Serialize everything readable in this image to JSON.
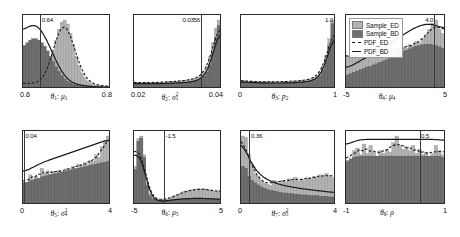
{
  "figure": {
    "type": "histogram-grid",
    "rows": 2,
    "cols": 4,
    "background": "#ffffff",
    "colors": {
      "sample_ed": "#b3b3b3",
      "sample_bd": "#6e6e6e",
      "pdf_ed": "#1a1a1a",
      "pdf_bd": "#1a1a1a",
      "axis": "#2b2b2b",
      "vline": "#3a3a3a"
    }
  },
  "legend": {
    "position": "top-right-panel",
    "items": [
      {
        "label": "Sample_ED",
        "marker": "swatch",
        "color": "#b3b3b3"
      },
      {
        "label": "Sample_BD",
        "marker": "swatch",
        "color": "#6e6e6e"
      },
      {
        "label": "PDF_ED",
        "marker": "dashed-line",
        "color": "#1a1a1a"
      },
      {
        "label": "PDF_BD",
        "marker": "solid-line",
        "color": "#1a1a1a"
      }
    ]
  },
  "chart_data": {
    "type": "bar",
    "title": "",
    "xlabel": "",
    "ylabel": "",
    "grid": false,
    "legend": [
      "Sample_ED",
      "Sample_BD",
      "PDF_ED",
      "PDF_BD"
    ],
    "panels": [
      {
        "index": 1,
        "xlabel_theta": "θ",
        "xlabel_theta_sub": "1",
        "xlabel_param": "μ",
        "xlabel_param_sub": "1",
        "xlabel_param_sup": "",
        "xlabel_text": "θ₁: μ₁",
        "xmin": 0.6,
        "xmax": 0.8,
        "xticks": [
          "0.6",
          "0.8"
        ],
        "vline_value": 0.64,
        "vline_label": "0.64",
        "vline_label_side": "right",
        "ed_values": [
          0.06,
          0.05,
          0.05,
          0.05,
          0.06,
          0.07,
          0.09,
          0.12,
          0.2,
          0.34,
          0.52,
          0.7,
          0.86,
          0.97,
          1.0,
          0.94,
          0.8,
          0.63,
          0.46,
          0.32,
          0.21,
          0.14,
          0.09,
          0.06,
          0.04,
          0.03,
          0.02,
          0.02,
          0.01,
          0.01
        ],
        "bd_values": [
          0.62,
          0.66,
          0.7,
          0.72,
          0.72,
          0.7,
          0.66,
          0.61,
          0.54,
          0.46,
          0.38,
          0.3,
          0.23,
          0.17,
          0.12,
          0.08,
          0.06,
          0.04,
          0.03,
          0.02,
          0.02,
          0.01,
          0.01,
          0.01,
          0.0,
          0.0,
          0.0,
          0.0,
          0.0,
          0.0
        ]
      },
      {
        "index": 2,
        "xlabel_theta": "θ",
        "xlabel_theta_sub": "2",
        "xlabel_param": "σ",
        "xlabel_param_sub": "1",
        "xlabel_param_sup": "2",
        "xlabel_text": "θ₂: σ₁²",
        "xmin": 0.02,
        "xmax": 0.04,
        "xticks": [
          "0.02",
          "0.04"
        ],
        "vline_value": 0.0356,
        "vline_label": "0.0356",
        "vline_label_side": "left",
        "ed_values": [
          0.07,
          0.07,
          0.06,
          0.07,
          0.07,
          0.06,
          0.07,
          0.07,
          0.07,
          0.07,
          0.07,
          0.08,
          0.08,
          0.08,
          0.08,
          0.09,
          0.09,
          0.1,
          0.1,
          0.11,
          0.12,
          0.13,
          0.15,
          0.18,
          0.23,
          0.31,
          0.45,
          0.66,
          0.88,
          1.0
        ],
        "bd_values": [
          0.05,
          0.05,
          0.05,
          0.05,
          0.05,
          0.05,
          0.05,
          0.05,
          0.05,
          0.05,
          0.05,
          0.05,
          0.05,
          0.06,
          0.06,
          0.06,
          0.06,
          0.06,
          0.07,
          0.07,
          0.08,
          0.09,
          0.1,
          0.12,
          0.16,
          0.22,
          0.33,
          0.52,
          0.74,
          0.92
        ]
      },
      {
        "index": 3,
        "xlabel_theta": "θ",
        "xlabel_theta_sub": "3",
        "xlabel_param": "p",
        "xlabel_param_sub": "2",
        "xlabel_param_sup": "",
        "xlabel_text": "θ₃: p₂",
        "xmin": 0,
        "xmax": 1,
        "xticks": [
          "0",
          "1"
        ],
        "vline_value": 1.0,
        "vline_label": "1.0",
        "vline_label_side": "left",
        "ed_values": [
          0.1,
          0.09,
          0.08,
          0.09,
          0.08,
          0.08,
          0.08,
          0.07,
          0.08,
          0.08,
          0.08,
          0.07,
          0.08,
          0.08,
          0.08,
          0.08,
          0.09,
          0.09,
          0.09,
          0.1,
          0.1,
          0.11,
          0.12,
          0.14,
          0.17,
          0.22,
          0.31,
          0.47,
          0.72,
          1.0
        ],
        "bd_values": [
          0.08,
          0.07,
          0.07,
          0.07,
          0.07,
          0.06,
          0.06,
          0.06,
          0.06,
          0.06,
          0.06,
          0.06,
          0.06,
          0.06,
          0.06,
          0.06,
          0.06,
          0.07,
          0.07,
          0.07,
          0.08,
          0.08,
          0.09,
          0.1,
          0.13,
          0.17,
          0.25,
          0.39,
          0.62,
          0.95
        ]
      },
      {
        "index": 4,
        "xlabel_theta": "θ",
        "xlabel_theta_sub": "4",
        "xlabel_param": "μ",
        "xlabel_param_sub": "4",
        "xlabel_param_sup": "",
        "xlabel_text": "θ₄: μ₄",
        "xmin": -5,
        "xmax": 5,
        "xticks": [
          "-5",
          "5"
        ],
        "vline_value": 4.0,
        "vline_label": "4.0",
        "vline_label_side": "left",
        "ed_values": [
          0.46,
          0.47,
          0.45,
          0.5,
          0.46,
          0.52,
          0.47,
          0.51,
          0.46,
          0.52,
          0.48,
          0.53,
          0.5,
          0.55,
          0.52,
          0.58,
          0.55,
          0.6,
          0.58,
          0.63,
          0.62,
          0.68,
          0.66,
          0.72,
          0.78,
          0.86,
          0.95,
          1.0,
          0.86,
          0.8
        ],
        "bd_values": [
          0.18,
          0.2,
          0.22,
          0.24,
          0.26,
          0.28,
          0.3,
          0.31,
          0.33,
          0.35,
          0.37,
          0.39,
          0.41,
          0.44,
          0.46,
          0.48,
          0.5,
          0.53,
          0.55,
          0.57,
          0.59,
          0.61,
          0.62,
          0.63,
          0.64,
          0.64,
          0.63,
          0.62,
          0.6,
          0.58
        ]
      },
      {
        "index": 5,
        "xlabel_theta": "θ",
        "xlabel_theta_sub": "5",
        "xlabel_param": "σ",
        "xlabel_param_sub": "4",
        "xlabel_param_sup": "2",
        "xlabel_text": "θ₅: σ₄²",
        "xmin": 0,
        "xmax": 4,
        "xticks": [
          "0",
          "4"
        ],
        "vline_value": 0.04,
        "vline_label": "0.04",
        "vline_label_side": "right",
        "ed_values": [
          0.31,
          0.3,
          0.42,
          0.36,
          0.4,
          0.36,
          0.52,
          0.44,
          0.48,
          0.43,
          0.47,
          0.45,
          0.49,
          0.47,
          0.48,
          0.52,
          0.5,
          0.55,
          0.52,
          0.58,
          0.56,
          0.6,
          0.58,
          0.64,
          0.62,
          0.72,
          0.68,
          0.84,
          0.94,
          1.0
        ],
        "bd_values": [
          0.3,
          0.31,
          0.33,
          0.34,
          0.36,
          0.37,
          0.39,
          0.4,
          0.41,
          0.42,
          0.43,
          0.44,
          0.45,
          0.46,
          0.47,
          0.48,
          0.49,
          0.5,
          0.51,
          0.52,
          0.53,
          0.54,
          0.55,
          0.56,
          0.57,
          0.58,
          0.59,
          0.6,
          0.61,
          0.62
        ]
      },
      {
        "index": 6,
        "xlabel_theta": "θ",
        "xlabel_theta_sub": "6",
        "xlabel_param": "μ",
        "xlabel_param_sub": "5",
        "xlabel_param_sup": "",
        "xlabel_text": "θ₆: μ₅",
        "xmin": -5,
        "xmax": 5,
        "xticks": [
          "-5",
          "5"
        ],
        "vline_value": -1.5,
        "vline_label": "-1.5",
        "vline_label_side": "right",
        "ed_values": [
          0.55,
          0.96,
          1.0,
          0.72,
          0.3,
          0.14,
          0.08,
          0.06,
          0.05,
          0.05,
          0.05,
          0.06,
          0.07,
          0.09,
          0.11,
          0.13,
          0.15,
          0.17,
          0.18,
          0.19,
          0.2,
          0.2,
          0.21,
          0.21,
          0.21,
          0.2,
          0.19,
          0.18,
          0.17,
          0.18
        ],
        "bd_values": [
          0.5,
          0.92,
          0.97,
          0.68,
          0.26,
          0.11,
          0.06,
          0.04,
          0.03,
          0.03,
          0.03,
          0.03,
          0.04,
          0.05,
          0.05,
          0.06,
          0.06,
          0.06,
          0.07,
          0.07,
          0.07,
          0.07,
          0.07,
          0.07,
          0.07,
          0.07,
          0.06,
          0.06,
          0.06,
          0.06
        ]
      },
      {
        "index": 7,
        "xlabel_theta": "θ",
        "xlabel_theta_sub": "7",
        "xlabel_param": "σ",
        "xlabel_param_sub": "5",
        "xlabel_param_sup": "2",
        "xlabel_text": "θ₇: σ₅²",
        "xmin": 0,
        "xmax": 4,
        "xticks": [
          "0",
          "4"
        ],
        "vline_value": 0.36,
        "vline_label": "0.36",
        "vline_label_side": "right",
        "ed_values": [
          1.0,
          0.98,
          0.72,
          0.58,
          0.44,
          0.4,
          0.34,
          0.3,
          0.28,
          0.26,
          0.34,
          0.32,
          0.3,
          0.34,
          0.32,
          0.36,
          0.34,
          0.38,
          0.33,
          0.36,
          0.34,
          0.38,
          0.36,
          0.4,
          0.38,
          0.42,
          0.4,
          0.44,
          0.41,
          0.38
        ],
        "bd_values": [
          0.55,
          0.52,
          0.4,
          0.34,
          0.3,
          0.27,
          0.24,
          0.22,
          0.2,
          0.19,
          0.18,
          0.17,
          0.16,
          0.15,
          0.15,
          0.14,
          0.14,
          0.13,
          0.13,
          0.12,
          0.12,
          0.12,
          0.11,
          0.11,
          0.11,
          0.1,
          0.1,
          0.1,
          0.09,
          0.09
        ]
      },
      {
        "index": 8,
        "xlabel_theta": "θ",
        "xlabel_theta_sub": "8",
        "xlabel_param": "ρ",
        "xlabel_param_sub": "",
        "xlabel_param_sup": "",
        "xlabel_text": "θ₈: ρ",
        "xmin": -1,
        "xmax": 1,
        "xticks": [
          "-1",
          "1"
        ],
        "vline_value": 0.5,
        "vline_label": "0.5",
        "vline_label_side": "right",
        "ed_values": [
          0.64,
          0.63,
          0.78,
          0.82,
          0.72,
          0.88,
          0.74,
          0.86,
          0.76,
          0.7,
          0.78,
          0.74,
          0.8,
          0.76,
          0.9,
          1.0,
          0.86,
          0.8,
          0.84,
          0.78,
          0.86,
          0.74,
          0.8,
          0.72,
          0.76,
          0.7,
          0.74,
          0.86,
          0.78,
          0.72
        ],
        "bd_values": [
          0.62,
          0.66,
          0.68,
          0.69,
          0.7,
          0.7,
          0.7,
          0.7,
          0.7,
          0.7,
          0.7,
          0.7,
          0.7,
          0.7,
          0.7,
          0.7,
          0.7,
          0.7,
          0.7,
          0.7,
          0.7,
          0.7,
          0.7,
          0.7,
          0.7,
          0.7,
          0.7,
          0.7,
          0.7,
          0.68
        ]
      }
    ],
    "pdf_curves": {
      "note": "PDF_ED drawn dashed, PDF_BD drawn solid; both overlay the histograms"
    }
  }
}
